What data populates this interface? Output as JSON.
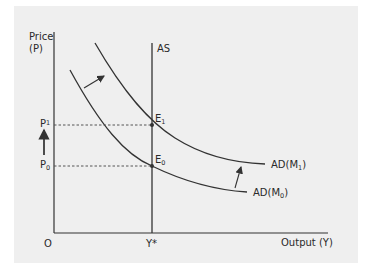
{
  "diagram": {
    "axes": {
      "y_label_line1": "Price",
      "y_label_line2": "(P)",
      "x_label": "Output (Y)",
      "origin": "O"
    },
    "curves": {
      "as_label": "AS",
      "ad1_label": "AD(M",
      "ad1_sub": "1",
      "ad0_label": "AD(M",
      "ad0_sub": "0",
      "close_paren": ")"
    },
    "points": {
      "e1": "E",
      "e1_sub": "1",
      "e0": "E",
      "e0_sub": "0"
    },
    "prices": {
      "p1": "P",
      "p1_sub": "1",
      "p0": "P",
      "p0_sub": "0"
    },
    "output_mark": "Y*",
    "colors": {
      "panel": "#efefef",
      "line": "#333333",
      "dash": "#555555"
    }
  }
}
